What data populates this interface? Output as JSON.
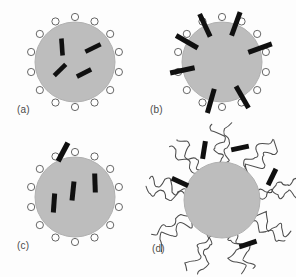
{
  "figure": {
    "background_color": "#fdfdfd",
    "sphere_fill": "#bdbdbd",
    "sphere_stroke": "#b0b0b0",
    "bead_fill": "#ffffff",
    "bead_stroke": "#555555",
    "rod_color": "#101010",
    "chain_color": "#4d4d4d",
    "label_color": "#4a4a4a",
    "panels": [
      {
        "id": "a",
        "label": "(a)",
        "center_x": 75,
        "center_y": 62,
        "radius": 40,
        "corona_type": "beads",
        "bead_count": 14,
        "bead_radius": 3.6,
        "bead_orbit": 45,
        "rod_count": 4,
        "rod_placement": "interior-random",
        "rods": [
          {
            "cx": 62,
            "cy": 47,
            "angle": -4,
            "length": 17,
            "width": 4.6
          },
          {
            "cx": 93,
            "cy": 48,
            "angle": 64,
            "length": 17,
            "width": 4.6
          },
          {
            "cx": 60,
            "cy": 70,
            "angle": 46,
            "length": 16,
            "width": 4.6
          },
          {
            "cx": 84,
            "cy": 73,
            "angle": 63,
            "length": 16,
            "width": 4.6
          }
        ]
      },
      {
        "id": "b",
        "label": "(b)",
        "center_x": 222,
        "center_y": 62,
        "radius": 40,
        "corona_type": "beads",
        "bead_count": 14,
        "bead_radius": 3.6,
        "bead_orbit": 45,
        "rod_count": 7,
        "rod_placement": "radial-surface",
        "rods": [
          {
            "angle_deg": 258,
            "inner": 28,
            "outer": 53,
            "width": 5.0
          },
          {
            "angle_deg": 300,
            "inner": 28,
            "outer": 53,
            "width": 5.0
          },
          {
            "angle_deg": 335,
            "inner": 28,
            "outer": 53,
            "width": 5.0
          },
          {
            "angle_deg": 20,
            "inner": 28,
            "outer": 53,
            "width": 5.0
          },
          {
            "angle_deg": 70,
            "inner": 28,
            "outer": 53,
            "width": 5.0
          },
          {
            "angle_deg": 150,
            "inner": 28,
            "outer": 53,
            "width": 5.0
          },
          {
            "angle_deg": 196,
            "inner": 28,
            "outer": 53,
            "width": 5.0
          }
        ]
      },
      {
        "id": "c",
        "label": "(c)",
        "center_x": 75,
        "center_y": 197,
        "radius": 40,
        "corona_type": "beads",
        "bead_count": 14,
        "bead_radius": 3.6,
        "bead_orbit": 45,
        "rod_count": 4,
        "rod_placement": "interior-aligned-vertical",
        "rods": [
          {
            "cx": 54,
            "cy": 203,
            "angle": 4,
            "length": 19,
            "width": 5.0
          },
          {
            "cx": 73,
            "cy": 191,
            "angle": 6,
            "length": 19,
            "width": 5.0
          },
          {
            "cx": 95,
            "cy": 183,
            "angle": -2,
            "length": 19,
            "width": 5.0
          },
          {
            "cx": 63,
            "cy": 152,
            "angle": 28,
            "length": 21,
            "width": 5.4
          }
        ]
      },
      {
        "id": "d",
        "label": "(d)",
        "center_x": 222,
        "center_y": 200,
        "radius": 38,
        "corona_type": "polymer-chains",
        "chain_count": 18,
        "chain_length": 40,
        "rod_count": 5,
        "rod_placement": "corona-scattered",
        "rods": [
          {
            "cx": 204,
            "cy": 150,
            "angle": 9,
            "length": 18,
            "width": 5.0
          },
          {
            "cx": 240,
            "cy": 148,
            "angle": 78,
            "length": 18,
            "width": 5.0
          },
          {
            "cx": 272,
            "cy": 177,
            "angle": 26,
            "length": 18,
            "width": 5.0
          },
          {
            "cx": 180,
            "cy": 182,
            "angle": 115,
            "length": 18,
            "width": 5.0
          },
          {
            "cx": 248,
            "cy": 244,
            "angle": 72,
            "length": 18,
            "width": 5.0
          }
        ]
      }
    ]
  }
}
